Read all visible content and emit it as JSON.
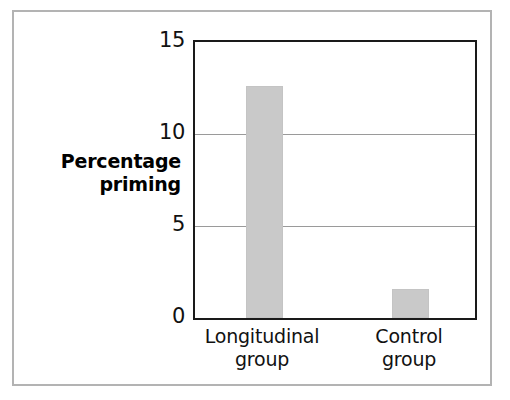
{
  "chart_data": {
    "type": "bar",
    "title": "",
    "subtitle": "",
    "xlabel": "",
    "ylabel": "Percentage priming",
    "ylabel_lines": [
      "Percentage",
      "priming"
    ],
    "categories": [
      "Longitudinal group",
      "Control group"
    ],
    "category_lines": [
      [
        "Longitudinal",
        "group"
      ],
      [
        "Control",
        "group"
      ]
    ],
    "values": [
      12.6,
      1.6
    ],
    "ylim": [
      0,
      15
    ],
    "yticks": [
      0,
      5,
      10,
      15
    ],
    "ytick_labels": [
      "0",
      "5",
      "10",
      "15"
    ],
    "grid": true,
    "gridlines_at": [
      5,
      10
    ],
    "legend": "none",
    "bar_color": "#c9c9c9",
    "axis_color": "#1a1a1a",
    "gridline_color": "#9a9a9a",
    "frame_color": "#b3b3b3",
    "text_color": "#111111",
    "background": "#ffffff"
  }
}
